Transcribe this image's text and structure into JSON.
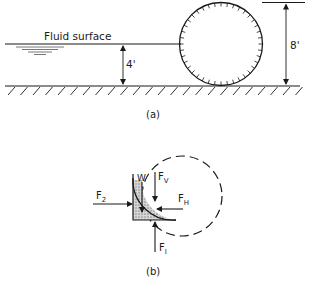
{
  "part_a": {
    "fluid_surface_label": "Fluid surface",
    "depth_label": "4'",
    "diameter_label": "8'",
    "caption": "(a)"
  },
  "part_b": {
    "caption": "(b)",
    "forces": {
      "f2": "F",
      "f2_sub": "2",
      "w": "W",
      "fv": "F",
      "fv_sub": "V",
      "fh": "F",
      "fh_sub": "H",
      "f1": "F",
      "f1_sub": "I"
    }
  },
  "colors": {
    "ink": "#1a1a1a",
    "shade": "#bdbdbd"
  }
}
